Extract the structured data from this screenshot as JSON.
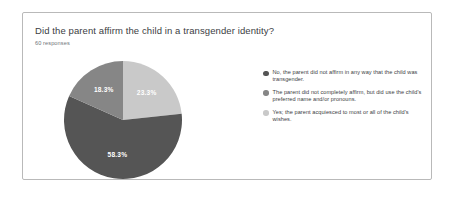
{
  "card": {
    "title": "Did the parent affirm the child in a transgender identity?",
    "response_count": "60 responses"
  },
  "colors": {
    "slice_dark": "#555555",
    "slice_medium": "#868686",
    "slice_light": "#c9c9c9",
    "card_border": "#b9b9b9",
    "title_text": "#3c4043",
    "subtitle_text": "#70757a",
    "label_text": "#ffffff",
    "background": "#ffffff"
  },
  "legend": {
    "items": [
      {
        "label": "No, the parent did not affirm in any way that the child was transgender.",
        "color": "#555555",
        "bullet_icon": "legend-dot-icon"
      },
      {
        "label": "The parent did not completely affirm, but did use the child's preferred name and/or pronouns.",
        "color": "#868686",
        "bullet_icon": "legend-dot-icon"
      },
      {
        "label": "Yes; the parent acquiesced to most or all of the child's wishes.",
        "color": "#c9c9c9",
        "bullet_icon": "legend-dot-icon"
      }
    ]
  },
  "chart_data": {
    "type": "pie",
    "title": "Did the parent affirm the child in a transgender identity?",
    "subtitle": "60 responses",
    "total_responses": 60,
    "legend_position": "right",
    "start_angle_deg": 0,
    "direction": "clockwise",
    "categories": [
      "No, the parent did not affirm in any way that the child was transgender.",
      "The parent did not completely affirm, but did use the child's preferred name and/or pronouns.",
      "Yes; the parent acquiesced to most or all of the child's wishes."
    ],
    "values": [
      58.3,
      18.3,
      23.3
    ],
    "value_labels": [
      "58.3%",
      "18.3%",
      "23.3%"
    ],
    "counts": [
      35,
      11,
      14
    ],
    "colors": [
      "#555555",
      "#868686",
      "#c9c9c9"
    ],
    "slices_clockwise_from_top": [
      {
        "label": "23.3%",
        "value": 23.3,
        "color": "#c9c9c9"
      },
      {
        "label": "58.3%",
        "value": 58.3,
        "color": "#555555"
      },
      {
        "label": "18.3%",
        "value": 18.3,
        "color": "#868686"
      }
    ]
  }
}
